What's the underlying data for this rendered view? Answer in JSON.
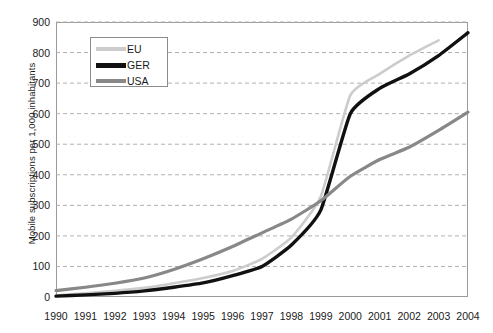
{
  "chart_data": {
    "type": "line",
    "title": "",
    "xlabel": "",
    "ylabel": "Mobile subscriptions per 1,000 inhabitants",
    "categories": [
      1990,
      1991,
      1992,
      1993,
      1994,
      1995,
      1996,
      1997,
      1998,
      1999,
      2000,
      2001,
      2002,
      2003,
      2004
    ],
    "x": [
      "1990",
      "1991",
      "1992",
      "1993",
      "1994",
      "1995",
      "1996",
      "1997",
      "1998",
      "1999",
      "2000",
      "2001",
      "2002",
      "2003",
      "2004"
    ],
    "xlim": [
      1990,
      2004
    ],
    "ylim": [
      0,
      900
    ],
    "y_ticks": [
      "0",
      "100",
      "200",
      "300",
      "400",
      "500",
      "600",
      "700",
      "800",
      "900"
    ],
    "y_tick_values": [
      0,
      100,
      200,
      300,
      400,
      500,
      600,
      700,
      800,
      900
    ],
    "grid": "horizontal-dashed",
    "legend_position": "upper-left-inside",
    "series": [
      {
        "name": "EU",
        "color": "#cccccc",
        "width": 2.6,
        "values": [
          5,
          12,
          20,
          30,
          45,
          62,
          85,
          125,
          195,
          330,
          660,
          730,
          790,
          840,
          null
        ]
      },
      {
        "name": "GER",
        "color": "#111111",
        "width": 3.4,
        "values": [
          3,
          7,
          12,
          20,
          32,
          46,
          70,
          100,
          170,
          285,
          600,
          683,
          730,
          790,
          865
        ]
      },
      {
        "name": "USA",
        "color": "#888888",
        "width": 3.2,
        "values": [
          21,
          32,
          45,
          62,
          90,
          125,
          165,
          210,
          255,
          315,
          395,
          450,
          490,
          545,
          605
        ]
      }
    ]
  }
}
